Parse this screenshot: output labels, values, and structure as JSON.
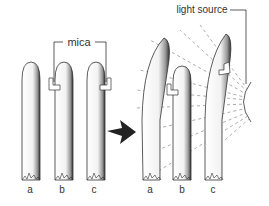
{
  "diagram": {
    "labels": {
      "mica": "mica",
      "light_source": "light source"
    },
    "before": {
      "plants": [
        {
          "id": "a",
          "label": "a"
        },
        {
          "id": "b",
          "label": "b"
        },
        {
          "id": "c",
          "label": "c"
        }
      ]
    },
    "after": {
      "plants": [
        {
          "id": "a",
          "label": "a"
        },
        {
          "id": "b",
          "label": "b"
        },
        {
          "id": "c",
          "label": "c"
        }
      ]
    },
    "colors": {
      "stroke": "#333333",
      "shade": "#555555",
      "light_rays": "#888888"
    }
  }
}
